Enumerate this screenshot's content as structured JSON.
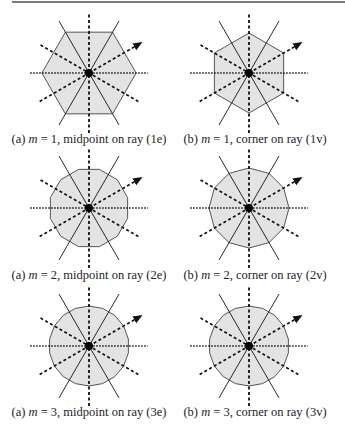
{
  "figure": {
    "panels": [
      {
        "id": "1e",
        "label": "(a)",
        "m": 1,
        "sides": 6,
        "orientation": "midpoint",
        "caption_suffix": ", midpoint on ray (1e)",
        "cx": 89,
        "cy": 73,
        "r": 44
      },
      {
        "id": "1v",
        "label": "(b)",
        "m": 1,
        "sides": 6,
        "orientation": "corner",
        "caption_suffix": ", corner on ray (1v)",
        "cx": 249,
        "cy": 73,
        "r": 40
      },
      {
        "id": "2e",
        "label": "(a)",
        "m": 2,
        "sides": 12,
        "orientation": "midpoint",
        "caption_suffix": ", midpoint on ray (2e)",
        "cx": 89,
        "cy": 208,
        "r": 40
      },
      {
        "id": "2v",
        "label": "(b)",
        "m": 2,
        "sides": 12,
        "orientation": "corner",
        "caption_suffix": ", corner on ray (2v)",
        "cx": 249,
        "cy": 208,
        "r": 40
      },
      {
        "id": "3e",
        "label": "(a)",
        "m": 3,
        "sides": 18,
        "orientation": "midpoint",
        "caption_suffix": ", midpoint on ray (3e)",
        "cx": 89,
        "cy": 346,
        "r": 40
      },
      {
        "id": "3v",
        "label": "(b)",
        "m": 3,
        "sides": 18,
        "orientation": "corner",
        "caption_suffix": ", corner on ray (3v)",
        "cx": 249,
        "cy": 346,
        "r": 40
      }
    ],
    "captions": [
      {
        "label": "(a)",
        "var": "m",
        "eq": " = 1",
        "rest": ", midpoint on ray (1e)"
      },
      {
        "label": "(b)",
        "var": "m",
        "eq": " = 1",
        "rest": ", corner on ray (1v)"
      },
      {
        "label": "(a)",
        "var": "m",
        "eq": " = 2",
        "rest": ", midpoint on ray (2e)"
      },
      {
        "label": "(b)",
        "var": "m",
        "eq": " = 2",
        "rest": ", corner on ray (2v)"
      },
      {
        "label": "(a)",
        "var": "m",
        "eq": " = 3",
        "rest": ", midpoint on ray (3e)"
      },
      {
        "label": "(b)",
        "var": "m",
        "eq": " = 3",
        "rest": ", corner on ray (3v)"
      }
    ],
    "colors": {
      "fill": "#e3e3e3",
      "stroke": "#555555",
      "ray": "#111111",
      "rule": "#7a7a7a"
    }
  }
}
